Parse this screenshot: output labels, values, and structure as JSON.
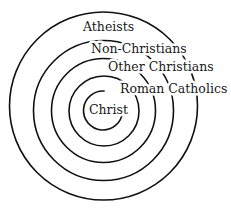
{
  "diagram": {
    "type": "concentric-circles",
    "stroke_color": "#111111",
    "background": "#ffffff",
    "rings": [
      {
        "name": "Christ",
        "cx": 103,
        "cy": 110.5,
        "r": 19.5,
        "gap_start_deg": -85,
        "gap_end_deg": 5
      },
      {
        "name": "Roman Catholics",
        "cx": 104,
        "cy": 111,
        "r": 35
      },
      {
        "name": "Other Christians",
        "cx": 103.5,
        "cy": 110.5,
        "r": 52
      },
      {
        "name": "Non-Christians",
        "cx": 103.5,
        "cy": 110.5,
        "r": 70
      },
      {
        "name": "Atheists",
        "cx": 103.5,
        "cy": 106,
        "r": 94
      }
    ],
    "labels": [
      {
        "text": "Atheists",
        "x": 83,
        "y": 31
      },
      {
        "text": "Non-Christians",
        "x": 91,
        "y": 53
      },
      {
        "text": "Other Christians",
        "x": 108,
        "y": 71
      },
      {
        "text": "Roman Catholics",
        "x": 120,
        "y": 93
      },
      {
        "text": "Christ",
        "x": 89,
        "y": 114
      }
    ]
  }
}
